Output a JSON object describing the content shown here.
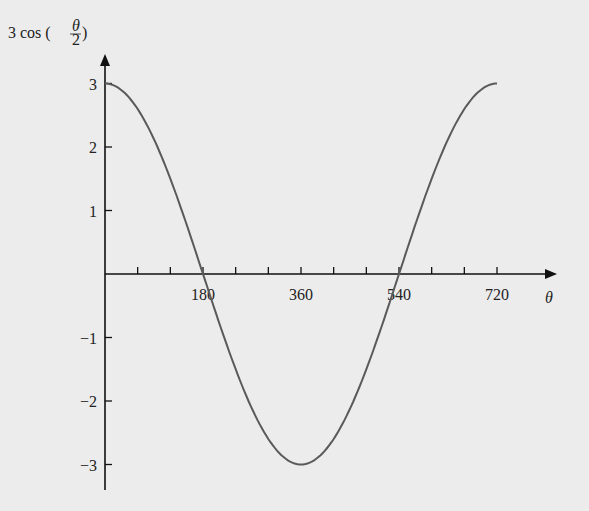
{
  "chart_data": {
    "type": "line",
    "title": "",
    "xlabel": "θ",
    "ylabel": "3 cos (θ/2)",
    "ylabel_parts": {
      "prefix": "3 cos (",
      "num": "θ",
      "den": "2",
      "suffix": ")"
    },
    "function": "3*cos(theta/2), theta in degrees",
    "xlim": [
      0,
      720
    ],
    "ylim": [
      -3,
      3
    ],
    "x_ticks_minor": [
      60,
      120,
      180,
      240,
      300,
      360,
      420,
      480,
      540,
      600,
      660,
      720
    ],
    "x_tick_labels": [
      "180",
      "360",
      "540",
      "720"
    ],
    "x_tick_label_values": [
      180,
      360,
      540,
      720
    ],
    "y_tick_labels": [
      "3",
      "2",
      "1",
      "−1",
      "−2",
      "−3"
    ],
    "y_tick_label_values": [
      3,
      2,
      1,
      -1,
      -2,
      -3
    ],
    "x": [
      0,
      90,
      180,
      270,
      360,
      450,
      540,
      630,
      720
    ],
    "values": [
      3,
      2.12,
      0,
      -2.12,
      -3,
      -2.12,
      0,
      2.12,
      3
    ],
    "grid": false,
    "legend": null,
    "colors": {
      "curve": "#5a5a5a",
      "axes": "#111111",
      "background": "#ececec"
    }
  }
}
